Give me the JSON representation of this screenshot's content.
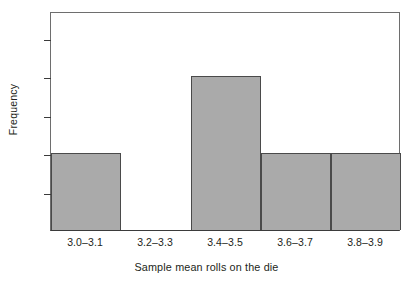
{
  "chart_data": {
    "type": "bar",
    "title": "",
    "subtitle": "",
    "xlabel": "Sample mean rolls on the die",
    "ylabel": "Frequency",
    "categories": [
      "3.0–3.1",
      "3.2–3.3",
      "3.4–3.5",
      "3.6–3.7",
      "3.8–3.9"
    ],
    "values": [
      1,
      0,
      2,
      1,
      1
    ],
    "series": [
      {
        "name": "Frequency",
        "values": [
          1,
          0,
          2,
          1,
          1
        ]
      }
    ],
    "ylim": [
      0,
      2.85
    ],
    "ytick_labels": [
      "0.5",
      "1.0",
      "1.5",
      "2.0",
      "2.5"
    ],
    "ytick_values": [
      0.5,
      1.0,
      1.5,
      2.0,
      2.5
    ],
    "grid": false,
    "legend": false,
    "legend_position": "none",
    "bar_fill_color": "#aaaaaa",
    "bar_edge_color": "#4a4a4a",
    "axis_color": "#3b3b3b",
    "frame_color": "#6e6e6e",
    "text_color": "#231f20",
    "background_color": "#ffffff"
  }
}
